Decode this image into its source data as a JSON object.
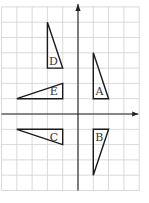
{
  "diagram": {
    "type": "coordinate-grid-triangles",
    "grid": {
      "x_min": -5,
      "x_max": 4,
      "y_min": -5,
      "y_max": 7,
      "origin_px": [
        78,
        114
      ],
      "unit_px": 15.3,
      "line_color": "#cfcfcf"
    },
    "axes": {
      "color": "#222222",
      "x_arrow": true,
      "y_arrow": true
    },
    "triangles": [
      {
        "label": "A",
        "vertices": [
          [
            1,
            4
          ],
          [
            1,
            1
          ],
          [
            2,
            1
          ]
        ],
        "label_pos": [
          1.15,
          1.15
        ]
      },
      {
        "label": "B",
        "vertices": [
          [
            1,
            -1
          ],
          [
            2,
            -1
          ],
          [
            1,
            -4
          ]
        ],
        "label_pos": [
          1.12,
          -1.85
        ]
      },
      {
        "label": "C",
        "vertices": [
          [
            -4,
            -1
          ],
          [
            -1,
            -1
          ],
          [
            -1,
            -2
          ]
        ],
        "label_pos": [
          -1.85,
          -1.85
        ]
      },
      {
        "label": "D",
        "vertices": [
          [
            -2,
            6
          ],
          [
            -2,
            3
          ],
          [
            -1,
            3
          ]
        ],
        "label_pos": [
          -1.9,
          3.15
        ]
      },
      {
        "label": "E",
        "vertices": [
          [
            -4,
            1
          ],
          [
            -1,
            1
          ],
          [
            -1,
            2
          ]
        ],
        "label_pos": [
          -1.85,
          1.15
        ]
      }
    ]
  }
}
